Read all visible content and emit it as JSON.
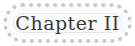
{
  "banner": {
    "title": "Chapter II",
    "border_color": "#c9c9c9",
    "text_color": "#3a3a3a"
  }
}
